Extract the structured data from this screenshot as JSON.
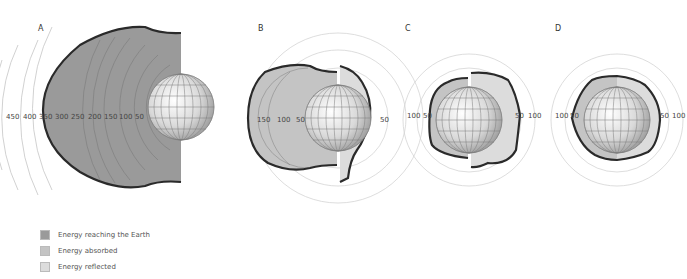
{
  "panels": [
    {
      "id": "A",
      "label": "A",
      "scale_labels": [
        "450",
        "400",
        "350",
        "300",
        "250",
        "200",
        "150",
        "100",
        "50"
      ]
    },
    {
      "id": "B",
      "label": "B",
      "scale_labels_left": [
        "150",
        "100",
        "50"
      ],
      "scale_labels_right": [
        "50"
      ]
    },
    {
      "id": "C",
      "label": "C",
      "scale_labels_left": [
        "100",
        "50"
      ],
      "scale_labels_right": [
        "50",
        "100"
      ]
    },
    {
      "id": "D",
      "label": "D",
      "scale_labels_left": [
        "100",
        "50"
      ],
      "scale_labels_right": [
        "50",
        "100"
      ]
    }
  ],
  "legend": {
    "items": [
      {
        "label": "Energy reaching the Earth",
        "color": "#9a9a9a"
      },
      {
        "label": "Energy absorbed",
        "color": "#c4c4c4"
      },
      {
        "label": "Energy reflected",
        "color": "#dcdcdc"
      }
    ]
  },
  "colors": {
    "reaching": "#9a9a9a",
    "absorbed": "#c4c4c4",
    "reflected": "#dcdcdc",
    "outline": "#2a2a2a",
    "arc": "#bdbdbd"
  }
}
